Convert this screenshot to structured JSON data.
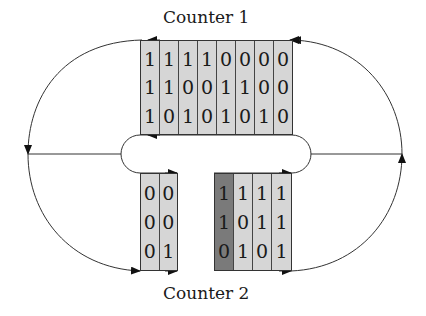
{
  "diagram": {
    "title_top": "Counter 1",
    "title_bottom": "Counter 2",
    "colors": {
      "cell_fill": "#d6d6d6",
      "highlight_cell_fill": "#7a7a7a",
      "line": "#333333"
    },
    "counter1": {
      "columns": [
        [
          "1",
          "1",
          "1"
        ],
        [
          "1",
          "1",
          "0"
        ],
        [
          "1",
          "0",
          "1"
        ],
        [
          "1",
          "0",
          "0"
        ],
        [
          "0",
          "1",
          "1"
        ],
        [
          "0",
          "1",
          "0"
        ],
        [
          "0",
          "0",
          "1"
        ],
        [
          "0",
          "0",
          "0"
        ]
      ],
      "rows": [
        "11110000",
        "11001100",
        "10101010"
      ]
    },
    "counter2_left": {
      "columns": [
        [
          "0",
          "0",
          "0"
        ],
        [
          "0",
          "0",
          "1"
        ]
      ],
      "rows": [
        "00",
        "00",
        "01"
      ]
    },
    "counter2_right": {
      "highlighted_column": 0,
      "columns": [
        [
          "1",
          "1",
          "0"
        ],
        [
          "1",
          "0",
          "1"
        ],
        [
          "1",
          "1",
          "0"
        ],
        [
          "1",
          "1",
          "1"
        ]
      ],
      "rows": [
        "1111",
        "1011",
        "0101"
      ]
    }
  }
}
